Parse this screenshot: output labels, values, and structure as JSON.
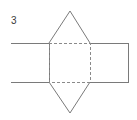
{
  "figure": {
    "label": "3",
    "label_position": {
      "x": 11,
      "y": 15
    },
    "canvas": {
      "width": 137,
      "height": 120,
      "background": "#ffffff"
    },
    "stroke_color": "#808080",
    "solid_stroke_color": "#7a7a7a",
    "dashed_stroke_color": "#8a8a8a",
    "stroke_width": 1,
    "dash_pattern": "3 2",
    "parts": {
      "center_square": {
        "name": "dashed-square",
        "style": "dashed",
        "x": 49,
        "y": 43,
        "width": 41,
        "height": 39,
        "points": "49,43 90,43 90,82 49,82"
      },
      "left_rectangle": {
        "name": "left-rectangle",
        "style": "solid",
        "x": 11,
        "y": 43,
        "width": 38,
        "height": 39,
        "points": "11,43 49,43 49,82 11,82"
      },
      "right_rectangle": {
        "name": "right-rectangle",
        "style": "solid",
        "x": 90,
        "y": 43,
        "width": 38,
        "height": 39,
        "points": "90,43 128,43 128,82 90,82"
      },
      "top_triangle": {
        "name": "top-triangle",
        "style": "solid",
        "apex": {
          "x": 70,
          "y": 11
        },
        "base_left": {
          "x": 49,
          "y": 43
        },
        "base_right": {
          "x": 90,
          "y": 43
        },
        "points": "49,43 70,11 90,43"
      },
      "bottom_triangle": {
        "name": "bottom-triangle",
        "style": "solid",
        "apex": {
          "x": 70,
          "y": 113
        },
        "base_left": {
          "x": 49,
          "y": 82
        },
        "base_right": {
          "x": 90,
          "y": 82
        },
        "points": "49,82 70,113 90,82"
      }
    }
  }
}
